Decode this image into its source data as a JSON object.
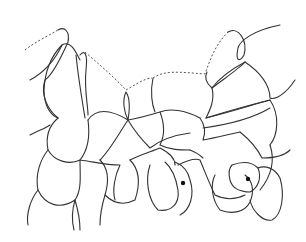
{
  "diagram": {
    "type": "cell-tissue-line-drawing",
    "stroke_color": "#333333",
    "background": "#ffffff",
    "labels": [],
    "marked_cells": [
      {
        "name": "nucleus-1",
        "cx": 183,
        "cy": 183
      },
      {
        "name": "nucleus-2",
        "cx": 248,
        "cy": 179
      }
    ],
    "dashed_edges_count": 3
  }
}
